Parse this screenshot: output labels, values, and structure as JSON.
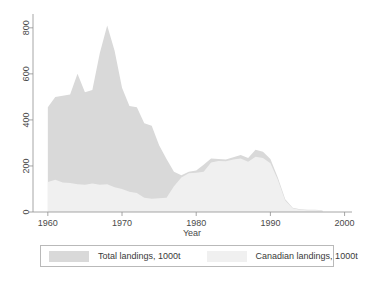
{
  "chart_data": {
    "type": "area",
    "title": "",
    "xlabel": "Year",
    "ylabel": "",
    "xlim": [
      1958,
      2001
    ],
    "ylim": [
      0,
      860
    ],
    "xticks": [
      1960,
      1970,
      1980,
      1990,
      2000
    ],
    "yticks": [
      0,
      200,
      400,
      600,
      800
    ],
    "grid": false,
    "legend_position": "below-plot",
    "x": [
      1960,
      1961,
      1962,
      1963,
      1964,
      1965,
      1966,
      1967,
      1968,
      1969,
      1970,
      1971,
      1972,
      1973,
      1974,
      1975,
      1976,
      1977,
      1978,
      1979,
      1980,
      1981,
      1982,
      1983,
      1984,
      1985,
      1986,
      1987,
      1988,
      1989,
      1990,
      1991,
      1992,
      1993,
      1994,
      1995,
      1996,
      1997
    ],
    "series": [
      {
        "name": "Total landings, 1000t",
        "color": "#d9d9d9",
        "values": [
          455,
          500,
          505,
          510,
          600,
          520,
          530,
          690,
          810,
          700,
          540,
          460,
          455,
          385,
          375,
          290,
          230,
          175,
          160,
          175,
          180,
          205,
          232,
          230,
          228,
          238,
          248,
          235,
          270,
          262,
          230,
          150,
          55,
          18,
          12,
          10,
          10,
          8
        ]
      },
      {
        "name": "Canadian landings, 1000t",
        "color": "#f0f0f0",
        "values": [
          130,
          140,
          128,
          126,
          120,
          118,
          124,
          118,
          120,
          108,
          100,
          88,
          82,
          62,
          58,
          60,
          62,
          112,
          150,
          168,
          170,
          175,
          215,
          222,
          220,
          228,
          232,
          218,
          240,
          235,
          212,
          140,
          50,
          16,
          10,
          8,
          8,
          7
        ]
      }
    ],
    "annotations": []
  },
  "axes": {
    "y_tick_labels": [
      "0",
      "200",
      "400",
      "600",
      "800"
    ],
    "x_tick_labels": [
      "1960",
      "1970",
      "1980",
      "1990",
      "2000"
    ],
    "x_axis_title": "Year"
  },
  "legend": {
    "entries": [
      {
        "label": "Total landings, 1000t",
        "color": "#d9d9d9"
      },
      {
        "label": "Canadian landings, 1000t",
        "color": "#f0f0f0"
      }
    ]
  },
  "colors": {
    "background": "#ffffff",
    "axis": "#909090",
    "text": "#3a3a3a",
    "total_fill": "#d9d9d9",
    "canadian_fill": "#f0f0f0",
    "legend_border": "#b9b9b9"
  }
}
